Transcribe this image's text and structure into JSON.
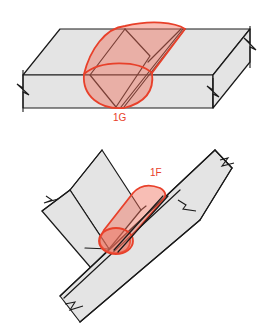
{
  "figures": [
    {
      "id": "1G",
      "label": "1G",
      "description": "Groove weld, flat position"
    },
    {
      "id": "1F",
      "label": "1F",
      "description": "Fillet weld, flat position"
    }
  ],
  "colors": {
    "weld_bead": "#e8402a",
    "weld_fill": "#f06e5a",
    "plate_fill": "#e4e4e4",
    "outline": "#1a1a1a",
    "background": "#ffffff"
  }
}
